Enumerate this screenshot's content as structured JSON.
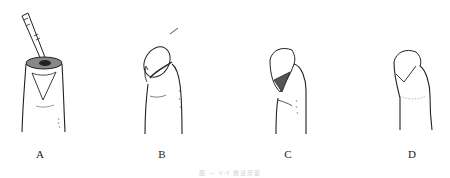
{
  "figure": {
    "panels": [
      {
        "id": "A",
        "label": "A",
        "description": "Fingertip stump with scalpel incising V-shaped flap"
      },
      {
        "id": "B",
        "label": "B",
        "description": "Flap advanced over tip with arrow indicating direction"
      },
      {
        "id": "C",
        "label": "C",
        "description": "Flap advanced covering tip, donor area visible"
      },
      {
        "id": "D",
        "label": "D",
        "description": "Flap sutured, V-Y closure completed"
      }
    ],
    "caption": "图 — V-Y 推进皮瓣"
  }
}
